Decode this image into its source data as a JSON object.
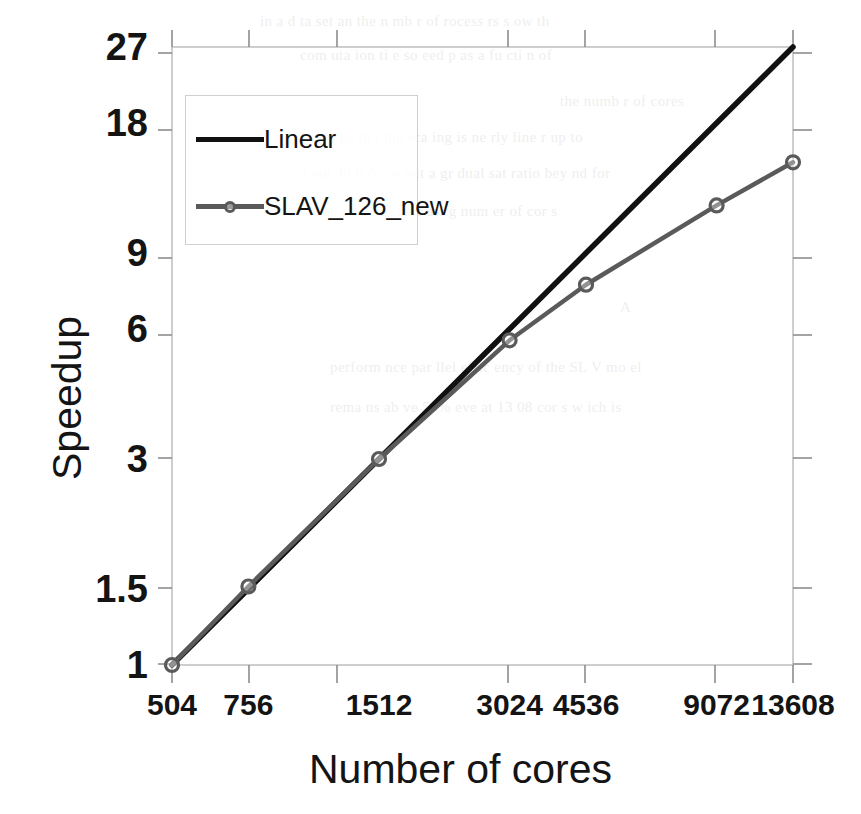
{
  "chart_data": {
    "type": "line",
    "title": "",
    "xlabel": "Number of cores",
    "ylabel": "Speedup",
    "xscale": "log",
    "yscale": "log",
    "xlim": [
      504,
      13608
    ],
    "ylim": [
      1,
      27
    ],
    "grid": false,
    "legend_position": "upper-left-inside",
    "x": [
      504,
      756,
      1512,
      3024,
      4536,
      9072,
      13608
    ],
    "xtick_labels": [
      "504",
      "756",
      "1512",
      "3024",
      "4536",
      "9072",
      "13608"
    ],
    "ytick_labels": [
      "27",
      "18",
      "9",
      "6",
      "3",
      "1.5",
      "1"
    ],
    "ytick_values": [
      27,
      18,
      9,
      6,
      3,
      1.5,
      1
    ],
    "series": [
      {
        "name": "Linear",
        "color": "#111111",
        "marker": "none",
        "values": [
          1,
          1.5,
          3,
          6,
          9,
          18,
          27
        ]
      },
      {
        "name": "SLAV_126_new",
        "color": "#5a5a5a",
        "marker": "circle",
        "values": [
          1,
          1.52,
          3.0,
          5.65,
          7.6,
          11.6,
          14.6
        ]
      }
    ],
    "legend": [
      {
        "label": "Linear",
        "color": "#111111",
        "marker": "none"
      },
      {
        "label": "SLAV_126_new",
        "color": "#5a5a5a",
        "marker": "circle"
      }
    ]
  },
  "background_text": {
    "lines": [
      "in a  d  ta  set  an  the  n mb  r of  rocess  rs  s ow  th",
      "com  uta  ion  ti  e  so  eed  p  as  a fu  cti  n of",
      "the  numb  r of  cores",
      "It  is  s en  th  t  the  sca  ing  is  ne  rly  line  r up  to",
      "a out  30 0  co es  wit  a  gr  dual  sat  ratio  bey  nd  for",
      "the  sp  ed p  wit  incr  asi  g  num  er  of  cor  s",
      "A",
      "perform  nce   par  llel  effic  ency  of  the  SL  V  mo  el",
      "rema  ns  ab  ve  50%  eve   at  13  08  cor  s  w  ich  is"
    ]
  }
}
